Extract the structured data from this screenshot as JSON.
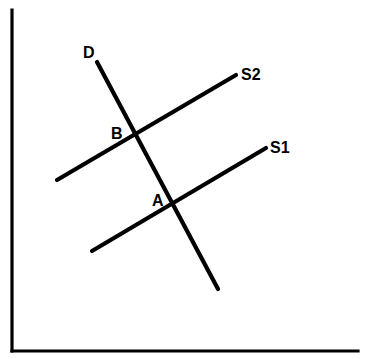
{
  "figure": {
    "background_color": "#ffffff",
    "line_color": "#000000",
    "width": 367,
    "height": 359
  },
  "axes": {
    "name": "cartesian-axes",
    "origin": {
      "x": 12,
      "y": 351
    },
    "y_axis": {
      "x1": 12,
      "y1": 10,
      "x2": 12,
      "y2": 351
    },
    "x_axis": {
      "x1": 12,
      "y1": 351,
      "x2": 358,
      "y2": 351
    },
    "stroke_width": 3.2,
    "x_label": "",
    "y_label": ""
  },
  "chart_data": {
    "type": "line",
    "title": "",
    "xlabel": "",
    "ylabel": "",
    "grid": false,
    "legend": "inline-end-labels",
    "xlim": [
      12,
      358
    ],
    "ylim": [
      351,
      10
    ],
    "series": [
      {
        "name": "D",
        "label": "D",
        "role": "demand-curve",
        "slope_direction": "downward",
        "x": [
          97,
          218
        ],
        "y": [
          62,
          289
        ],
        "color": "#000000",
        "stroke_width": 4.2
      },
      {
        "name": "S2",
        "label": "S2",
        "role": "supply-curve-shifted",
        "slope_direction": "upward",
        "x": [
          57,
          236
        ],
        "y": [
          180,
          75
        ],
        "color": "#000000",
        "stroke_width": 4.2
      },
      {
        "name": "S1",
        "label": "S1",
        "role": "supply-curve-original",
        "slope_direction": "upward",
        "x": [
          92,
          266
        ],
        "y": [
          251,
          148
        ],
        "color": "#000000",
        "stroke_width": 4.2
      }
    ],
    "annotations": [
      {
        "name": "point-B",
        "label": "B",
        "x": 133,
        "y": 133,
        "label_x": 111,
        "label_y": 139,
        "description": "intersection of D and S2"
      },
      {
        "name": "point-A",
        "label": "A",
        "x": 175,
        "y": 204,
        "label_x": 152,
        "label_y": 206,
        "description": "intersection of D and S1"
      }
    ]
  },
  "labels": {
    "demand": {
      "text": "D",
      "x": 83,
      "y": 58
    },
    "supply_shifted": {
      "text": "S2",
      "x": 241,
      "y": 80
    },
    "supply_original": {
      "text": "S1",
      "x": 270,
      "y": 153
    },
    "point_b": {
      "text": "B",
      "x": 111,
      "y": 139
    },
    "point_a": {
      "text": "A",
      "x": 152,
      "y": 206
    }
  }
}
